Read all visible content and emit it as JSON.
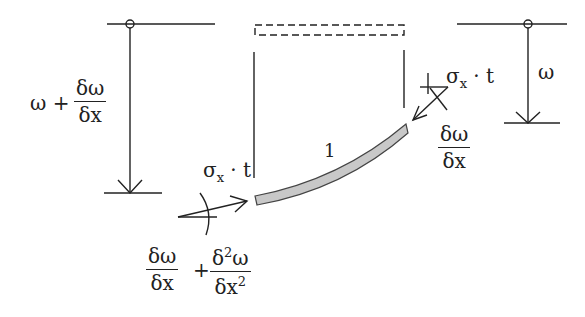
{
  "diagram": {
    "title": "",
    "colors": {
      "line": "#222222",
      "plate_fill": "#c8c8c8",
      "plate_stroke": "#444444",
      "background": "#ffffff"
    },
    "labels": {
      "left_deflection": {
        "prefix": "ω +",
        "num": "δω",
        "den": "δx"
      },
      "right_deflection": "ω",
      "element_length": "1",
      "stress_left": {
        "sigma": "σ",
        "sub": "x",
        "rest": "· t"
      },
      "stress_right": {
        "sigma": "σ",
        "sub": "x",
        "rest": "· t"
      },
      "slope_right": {
        "num": "δω",
        "den": "δx"
      },
      "slope_left": {
        "num1": "δω",
        "den1": "δx",
        "plus": "+",
        "num2_a": "δ",
        "num2_sup": "2",
        "num2_b": "ω",
        "den2_a": "δx",
        "den2_sup": "2"
      }
    },
    "elements": [
      {
        "name": "left-support",
        "type": "pin-with-arrow",
        "x": 130,
        "top": 24,
        "bottom": 193
      },
      {
        "name": "right-support",
        "type": "pin-with-arrow",
        "x": 528,
        "top": 24,
        "bottom": 123
      },
      {
        "name": "undeformed-element",
        "type": "dashed-rectangle",
        "x1": 255,
        "y1": 25,
        "x2": 404,
        "y2": 35
      },
      {
        "name": "deformed-plate",
        "type": "curved-strip",
        "from": [
          256,
          200
        ],
        "to": [
          406,
          132
        ]
      }
    ]
  }
}
